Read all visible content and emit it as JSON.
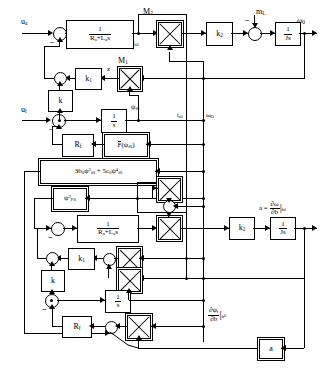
{
  "diagram": {
    "signals": {
      "u_a": "u",
      "u_a_sub": "a",
      "u_f": "u",
      "u_f_sub": "f",
      "m_L": "m",
      "m_L_sub": "L",
      "omega_0": "ω",
      "omega_0_sub": "0",
      "omega_O_mid": "ω",
      "omega_O_mid_sub": "O",
      "i_a0_top": "i",
      "i_a0_top_sub": "a0",
      "i_a0_mid": "i",
      "i_a0_mid_sub": "a0",
      "psi_f0": "ψ",
      "psi_f0_sub": "f0",
      "z": "z"
    },
    "multipliers": {
      "m2_label": "M",
      "m2_sub": "2",
      "m1_label": "M",
      "m1_sub": "1"
    },
    "blocks": {
      "arm_tf_num": "1",
      "arm_tf_den_Ra": "R",
      "arm_tf_den_Ra_sub": "a",
      "arm_tf_den_plus": "+",
      "arm_tf_den_La": "L",
      "arm_tf_den_La_sub": "a",
      "arm_tf_den_s": "s",
      "k2": "k",
      "k2_sub": "2",
      "k1": "k",
      "k1_sub": "1",
      "k": "k",
      "Js_num": "1",
      "Js_den": "Js",
      "int_num": "1",
      "int_den": "s",
      "Rf": "R",
      "Rf_sub": "f",
      "Fpsi_F": "F",
      "Fpsi_arg_open": "(",
      "Fpsi_psi": "ψ",
      "Fpsi_psi_sub": "f0",
      "Fpsi_arg_close": ")",
      "poly_3b": "3b",
      "poly_3b_sub": "0",
      "poly_psi1": "ψ",
      "poly_psi1_sup": "2",
      "poly_psi1_sub": "f0",
      "poly_plus": "+",
      "poly_5c": "5c",
      "poly_5c_sub": "0",
      "poly_psi2": "ψ",
      "poly_psi2_sup": "4",
      "poly_psi2_sub": "f0",
      "psi_cubed": "ψ",
      "psi_cubed_sup": "3",
      "psi_cubed_sub": "F0",
      "a_box": "a"
    },
    "outputs": {
      "sens_omega_eq": "a =",
      "sens_omega_num_d": "∂ω",
      "sens_omega_den_d": "∂b",
      "sens_omega_bar": "|",
      "sens_omega_eval": "b",
      "sens_omega_eval_sub": "0",
      "sens_psi_num_d": "∂ψ",
      "sens_psi_num_sub": "f",
      "sens_psi_den_d": "∂b",
      "sens_psi_bar": "|",
      "sens_psi_eval": "b",
      "sens_psi_eval_sub": "0"
    },
    "signs": {
      "minus": "−"
    }
  }
}
